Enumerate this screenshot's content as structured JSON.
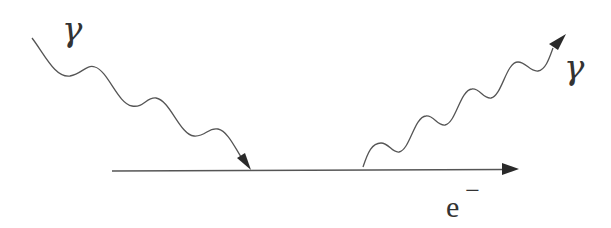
{
  "diagram": {
    "title": "",
    "labels": {
      "incoming_photon": "γ",
      "outgoing_photon": "γ",
      "electron_base": "e",
      "electron_charge": "−"
    },
    "colors": {
      "line": "#555555",
      "arrow": "#2a2a2a",
      "text": "#333333",
      "background": "#ffffff"
    },
    "elements": [
      {
        "id": "incoming-photon",
        "type": "wavy-line",
        "from": [
          32,
          38
        ],
        "to": [
          250,
          170
        ],
        "arrow": "end"
      },
      {
        "id": "electron-line",
        "type": "straight-line",
        "from": [
          112,
          171
        ],
        "to": [
          518,
          169
        ],
        "arrow": "end"
      },
      {
        "id": "outgoing-photon",
        "type": "wavy-line",
        "from": [
          363,
          167
        ],
        "to": [
          565,
          34
        ],
        "arrow": "end"
      }
    ]
  }
}
